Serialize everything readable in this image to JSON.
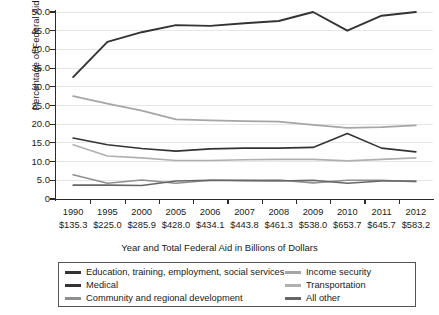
{
  "chart_data": {
    "type": "line",
    "title": "",
    "xlabel": "Year and Total Federal Aid in Billions of Dollars",
    "ylabel": "Percentage of Federal Aid",
    "categories": [
      "1990",
      "1995",
      "2000",
      "2005",
      "2006",
      "2007",
      "2008",
      "2009",
      "2010",
      "2011",
      "2012"
    ],
    "category_sublabels": [
      "$135.3",
      "$225.0",
      "$285.9",
      "$428.0",
      "$434.1",
      "$443.8",
      "$461.3",
      "$538.0",
      "$653.7",
      "$645.7",
      "$583.2"
    ],
    "ylim": [
      0,
      50
    ],
    "yticks": [
      "0",
      "5.0",
      "10.0",
      "15.0",
      "20.0",
      "25.0",
      "30.0",
      "35.0",
      "40.0",
      "45.0",
      "50.0"
    ],
    "ytick_values": [
      0,
      5,
      10,
      15,
      20,
      25,
      30,
      35,
      40,
      45,
      50
    ],
    "grid": true,
    "legend_position": "bottom",
    "series": [
      {
        "name": "Education, training, employment, social services",
        "color": "#333333",
        "width": 1.9,
        "values": [
          32.6,
          42.0,
          44.6,
          46.5,
          46.3,
          47.0,
          47.6,
          50.0,
          45.0,
          49.0,
          50.0
        ]
      },
      {
        "name": "Medical",
        "color": "#333333",
        "width": 1.6,
        "values": [
          16.3,
          14.5,
          13.5,
          12.8,
          13.4,
          13.6,
          13.6,
          13.8,
          17.5,
          13.6,
          12.6
        ]
      },
      {
        "name": "Community and regional development",
        "color": "#8f8f8f",
        "width": 1.6,
        "values": [
          6.5,
          4.2,
          5.1,
          4.2,
          5.0,
          5.0,
          5.1,
          4.3,
          5.0,
          5.0,
          4.6
        ]
      },
      {
        "name": "Income security",
        "color": "#a6a6a6",
        "width": 1.8,
        "values": [
          27.5,
          25.5,
          23.6,
          21.3,
          21.0,
          20.8,
          20.7,
          19.8,
          19.0,
          19.2,
          19.7
        ]
      },
      {
        "name": "Transportation",
        "color": "#b0b0b0",
        "width": 1.6,
        "values": [
          14.5,
          11.5,
          11.0,
          10.3,
          10.3,
          10.5,
          10.6,
          10.6,
          10.2,
          10.6,
          11.0
        ]
      },
      {
        "name": "All other",
        "color": "#666666",
        "width": 1.6,
        "values": [
          3.7,
          3.7,
          3.6,
          4.8,
          5.0,
          4.9,
          4.8,
          5.0,
          4.2,
          4.8,
          4.8
        ]
      }
    ]
  },
  "legend": {
    "left_column": [
      "Education, training, employment, social services",
      "Medical",
      "Community and regional development"
    ],
    "right_column": [
      "Income security",
      "Transportation",
      "All other"
    ]
  }
}
